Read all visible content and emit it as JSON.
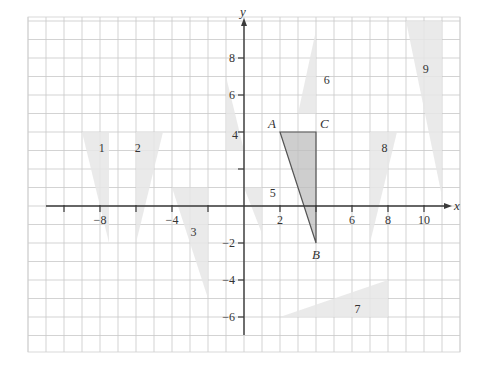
{
  "figure": {
    "axes": {
      "x_name": "x",
      "y_name": "y",
      "x_ticks": [
        -8,
        -4,
        2,
        6,
        8,
        10
      ],
      "x_tick_marks": [
        -10,
        -8,
        -6,
        -4,
        -2,
        2,
        4,
        6,
        8,
        10
      ],
      "y_ticks": [
        8,
        6,
        -2,
        -4,
        -6
      ],
      "y_tick_marks": [
        8,
        6,
        4,
        2,
        -2,
        -4,
        -6
      ],
      "x_range": [
        -11,
        12
      ],
      "y_range": [
        -7,
        10
      ]
    },
    "main_triangle": {
      "vertices": [
        {
          "label": "A",
          "x": 2,
          "y": 4
        },
        {
          "label": "C",
          "x": 4,
          "y": 4
        },
        {
          "label": "B",
          "x": 4,
          "y": -2
        }
      ]
    },
    "shapes": [
      {
        "label": "1",
        "points": [
          [
            -9,
            4
          ],
          [
            -7.5,
            4
          ],
          [
            -7.5,
            -2
          ]
        ],
        "label_pos": [
          -7.9,
          2.9
        ]
      },
      {
        "label": "2",
        "points": [
          [
            -6,
            4
          ],
          [
            -4.5,
            4
          ],
          [
            -6,
            -2
          ]
        ],
        "label_pos": [
          -5.9,
          2.9
        ]
      },
      {
        "label": "3",
        "points": [
          [
            -4,
            1
          ],
          [
            -2,
            1
          ],
          [
            -2,
            -5
          ]
        ],
        "label_pos": [
          -2.8,
          -1.6
        ]
      },
      {
        "label": "4",
        "points": [
          [
            -1,
            7
          ],
          [
            -1,
            3
          ],
          [
            0,
            3
          ]
        ],
        "label_pos": [
          -0.5,
          3.6
        ]
      },
      {
        "label": "5",
        "points": [
          [
            0,
            1
          ],
          [
            1,
            1
          ],
          [
            1,
            -1.5
          ]
        ],
        "label_pos": [
          1.6,
          0.5
        ]
      },
      {
        "label": "6",
        "points": [
          [
            4,
            9.5
          ],
          [
            3,
            5
          ],
          [
            4,
            5
          ]
        ],
        "label_pos": [
          4.6,
          6.6
        ]
      },
      {
        "label": "7",
        "points": [
          [
            2,
            -6
          ],
          [
            8,
            -6
          ],
          [
            8,
            -4
          ]
        ],
        "label_pos": [
          6.3,
          -5.8
        ]
      },
      {
        "label": "8",
        "points": [
          [
            7,
            4
          ],
          [
            8.5,
            4
          ],
          [
            7,
            -2
          ]
        ],
        "label_pos": [
          7.8,
          2.9
        ]
      },
      {
        "label": "9",
        "points": [
          [
            9,
            10
          ],
          [
            11,
            10
          ],
          [
            11,
            0.5
          ]
        ],
        "label_pos": [
          10.1,
          7.2
        ]
      }
    ]
  }
}
